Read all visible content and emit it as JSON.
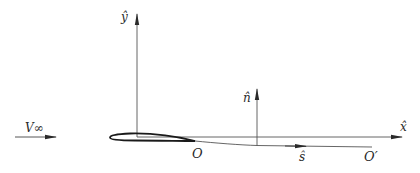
{
  "diagram": {
    "type": "airfoil-coordinate-schematic",
    "labels": {
      "y_axis": "ŷ",
      "x_axis": "x̂",
      "normal": "n̂",
      "tangent": "ŝ",
      "freestream": "V∞",
      "trailing_edge": "O",
      "wake_end": "O′"
    },
    "colors": {
      "line": "#2a2a2a",
      "background": "#ffffff"
    }
  }
}
